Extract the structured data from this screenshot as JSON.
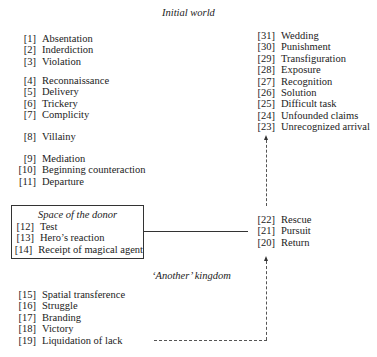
{
  "sections": {
    "initial_world": "Initial world",
    "space_of_donor": "Space of the donor",
    "another_kingdom": "‘Another’ kingdom"
  },
  "left_column": {
    "group1": [
      {
        "num": "[1]",
        "label": "Absentation"
      },
      {
        "num": "[2]",
        "label": "Inderdiction"
      },
      {
        "num": "[3]",
        "label": "Violation"
      }
    ],
    "group2": [
      {
        "num": "[4]",
        "label": "Reconnaissance"
      },
      {
        "num": "[5]",
        "label": "Delivery"
      },
      {
        "num": "[6]",
        "label": "Trickery"
      },
      {
        "num": "[7]",
        "label": "Complicity"
      }
    ],
    "group3": [
      {
        "num": "[8]",
        "label": "Villainy"
      }
    ],
    "group4": [
      {
        "num": "[9]",
        "label": "Mediation"
      },
      {
        "num": "[10]",
        "label": "Beginning counteraction"
      },
      {
        "num": "[11]",
        "label": "Departure"
      }
    ],
    "donor": [
      {
        "num": "[12]",
        "label": "Test"
      },
      {
        "num": "[13]",
        "label": "Hero’s reaction"
      },
      {
        "num": "[14]",
        "label": "Receipt of magical agent"
      }
    ],
    "kingdom": [
      {
        "num": "[15]",
        "label": "Spatial transference"
      },
      {
        "num": "[16]",
        "label": "Struggle"
      },
      {
        "num": "[17]",
        "label": "Branding"
      },
      {
        "num": "[18]",
        "label": "Victory"
      },
      {
        "num": "[19]",
        "label": "Liquidation of lack"
      }
    ]
  },
  "right_column": {
    "top": [
      {
        "num": "[31]",
        "label": "Wedding"
      },
      {
        "num": "[30]",
        "label": "Punishment"
      },
      {
        "num": "[29]",
        "label": "Transfiguration"
      },
      {
        "num": "[28]",
        "label": "Exposure"
      },
      {
        "num": "[27]",
        "label": "Recognition"
      },
      {
        "num": "[26]",
        "label": "Solution"
      },
      {
        "num": "[25]",
        "label": "Difficult task"
      },
      {
        "num": "[24]",
        "label": "Unfounded claims"
      },
      {
        "num": "[23]",
        "label": "Unrecognized arrival"
      }
    ],
    "middle": [
      {
        "num": "[22]",
        "label": "Rescue"
      },
      {
        "num": "[21]",
        "label": "Pursuit"
      },
      {
        "num": "[20]",
        "label": "Return"
      }
    ]
  }
}
